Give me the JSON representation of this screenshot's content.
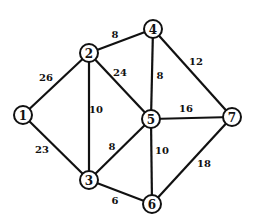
{
  "graph": {
    "type": "weighted-undirected-graph",
    "nodes": [
      {
        "id": "1",
        "label": "1",
        "x": 23,
        "y": 115
      },
      {
        "id": "2",
        "label": "2",
        "x": 89,
        "y": 53
      },
      {
        "id": "3",
        "label": "3",
        "x": 89,
        "y": 180
      },
      {
        "id": "4",
        "label": "4",
        "x": 153,
        "y": 29
      },
      {
        "id": "5",
        "label": "5",
        "x": 151,
        "y": 119
      },
      {
        "id": "6",
        "label": "6",
        "x": 152,
        "y": 204
      },
      {
        "id": "7",
        "label": "7",
        "x": 232,
        "y": 117
      }
    ],
    "edges": [
      {
        "from": "1",
        "to": "2",
        "weight": "26",
        "lx": 46,
        "ly": 77
      },
      {
        "from": "1",
        "to": "3",
        "weight": "23",
        "lx": 42,
        "ly": 149
      },
      {
        "from": "2",
        "to": "4",
        "weight": "8",
        "lx": 115,
        "ly": 34
      },
      {
        "from": "2",
        "to": "5",
        "weight": "24",
        "lx": 120,
        "ly": 72
      },
      {
        "from": "2",
        "to": "3",
        "weight": "10",
        "lx": 96,
        "ly": 109
      },
      {
        "from": "4",
        "to": "5",
        "weight": "8",
        "lx": 160,
        "ly": 75
      },
      {
        "from": "4",
        "to": "7",
        "weight": "12",
        "lx": 196,
        "ly": 61
      },
      {
        "from": "5",
        "to": "7",
        "weight": "16",
        "lx": 186,
        "ly": 108
      },
      {
        "from": "3",
        "to": "5",
        "weight": "8",
        "lx": 112,
        "ly": 146
      },
      {
        "from": "5",
        "to": "6",
        "weight": "10",
        "lx": 162,
        "ly": 150
      },
      {
        "from": "3",
        "to": "6",
        "weight": "6",
        "lx": 115,
        "ly": 200
      },
      {
        "from": "6",
        "to": "7",
        "weight": "18",
        "lx": 204,
        "ly": 163
      }
    ]
  },
  "style": {
    "line_color": "#111111",
    "background": "#ffffff",
    "node_radius": 9
  }
}
